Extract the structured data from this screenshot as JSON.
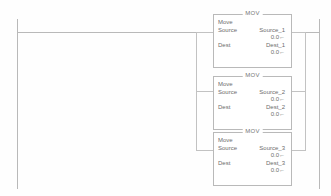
{
  "diagram": {
    "type": "ladder-logic-rung",
    "colors": {
      "background": "#fefefe",
      "rail": "#b9b9b9",
      "wire": "#c2c2c2",
      "text": "#6d6d6d"
    }
  },
  "blocks": [
    {
      "title": "MOV",
      "name": "Move",
      "source_label": "Source",
      "source_tag": "Source_1",
      "source_value": "0.0←",
      "dest_label": "Dest",
      "dest_tag": "Dest_1",
      "dest_value": "0.0←"
    },
    {
      "title": "MOV",
      "name": "Move",
      "source_label": "Source",
      "source_tag": "Source_2",
      "source_value": "0.0←",
      "dest_label": "Dest",
      "dest_tag": "Dest_2",
      "dest_value": "0.0←"
    },
    {
      "title": "MOV",
      "name": "Move",
      "source_label": "Source",
      "source_tag": "Source_3",
      "source_value": "0.0←",
      "dest_label": "Dest",
      "dest_tag": "Dest_3",
      "dest_value": "0.0←"
    }
  ]
}
